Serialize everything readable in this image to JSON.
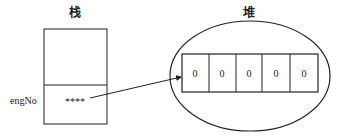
{
  "stack": {
    "title": "栈",
    "var_label": "engNo",
    "var_value": "****"
  },
  "heap": {
    "title": "堆",
    "cells": [
      "0",
      "0",
      "0",
      "0",
      "0"
    ]
  }
}
